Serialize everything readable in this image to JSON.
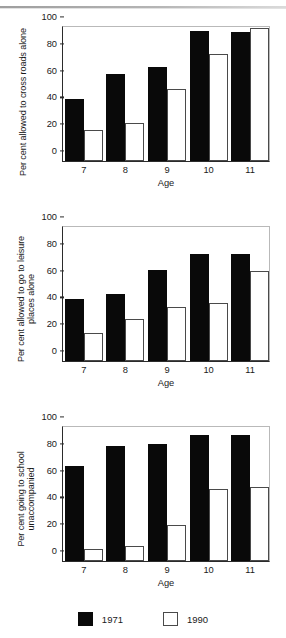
{
  "legend": {
    "entries": [
      {
        "label": "1971",
        "color": "#090909",
        "key": "1971"
      },
      {
        "label": "1990",
        "color": "#ffffff",
        "key": "1990"
      }
    ]
  },
  "axis": {
    "yticks": [
      "0",
      "20",
      "40",
      "60",
      "80",
      "100"
    ],
    "xticks": [
      "7",
      "8",
      "9",
      "10",
      "11"
    ],
    "xlabel": "Age"
  },
  "panels": [
    {
      "ylabel": "Per cent allowed to cross roads alone",
      "xlabel": "Age"
    },
    {
      "ylabel": "Per cent allowed to go to leisure\nplaces alone",
      "xlabel": "Age"
    },
    {
      "ylabel": "Per cent going to school\nunaccompanied",
      "xlabel": "Age"
    }
  ],
  "chart_data": [
    {
      "type": "bar",
      "title": "",
      "xlabel": "Age",
      "ylabel": "Per cent allowed to cross roads alone",
      "categories": [
        "7",
        "8",
        "9",
        "10",
        "11"
      ],
      "ylim": [
        0,
        100
      ],
      "yticks": [
        0,
        20,
        40,
        60,
        80,
        100
      ],
      "grid": false,
      "legend_position": "bottom",
      "series": [
        {
          "name": "1971",
          "color": "#090909",
          "values": [
            46,
            65,
            70,
            97,
            96
          ]
        },
        {
          "name": "1990",
          "color": "#ffffff",
          "values": [
            23,
            28,
            54,
            80,
            99
          ]
        }
      ]
    },
    {
      "type": "bar",
      "title": "",
      "xlabel": "Age",
      "ylabel": "Per cent allowed to go to leisure places alone",
      "categories": [
        "7",
        "8",
        "9",
        "10",
        "11"
      ],
      "ylim": [
        0,
        100
      ],
      "yticks": [
        0,
        20,
        40,
        60,
        80,
        100
      ],
      "grid": false,
      "legend_position": "bottom",
      "series": [
        {
          "name": "1971",
          "color": "#090909",
          "values": [
            46,
            50,
            68,
            80,
            80
          ]
        },
        {
          "name": "1990",
          "color": "#ffffff",
          "values": [
            21,
            31,
            40,
            43,
            67
          ]
        }
      ]
    },
    {
      "type": "bar",
      "title": "",
      "xlabel": "Age",
      "ylabel": "Per cent going to school unaccompanied",
      "categories": [
        "7",
        "8",
        "9",
        "10",
        "11"
      ],
      "ylim": [
        0,
        100
      ],
      "yticks": [
        0,
        20,
        40,
        60,
        80,
        100
      ],
      "grid": false,
      "legend_position": "bottom",
      "series": [
        {
          "name": "1971",
          "color": "#090909",
          "values": [
            71,
            86,
            87,
            94,
            94
          ]
        },
        {
          "name": "1990",
          "color": "#ffffff",
          "values": [
            9,
            11,
            27,
            54,
            55
          ]
        }
      ]
    }
  ]
}
